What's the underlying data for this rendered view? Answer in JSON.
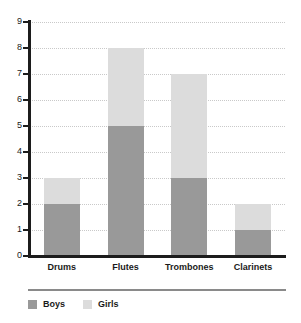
{
  "chart_data": {
    "type": "bar",
    "subtype": "stacked-vertical",
    "title": "",
    "subtitle": "",
    "xlabel": "",
    "ylabel": "",
    "categories": [
      "Drums",
      "Flutes",
      "Trombones",
      "Clarinets"
    ],
    "series": [
      {
        "name": "Boys",
        "color": "#999999",
        "values": [
          2,
          5,
          3,
          1
        ]
      },
      {
        "name": "Girls",
        "color": "#dcdcdc",
        "values": [
          1,
          3,
          4,
          1
        ]
      }
    ],
    "totals": [
      3,
      8,
      7,
      2
    ],
    "ylim": [
      0,
      9
    ],
    "ytick_step": 1,
    "ytick_labels": [
      "0",
      "1",
      "2",
      "3",
      "4",
      "5",
      "6",
      "7",
      "8",
      "9"
    ],
    "grid": true,
    "grid_style": "dotted-horizontal",
    "legend_position": "bottom-left",
    "legend_entries": [
      {
        "label": "Boys",
        "color": "#999999"
      },
      {
        "label": "Girls",
        "color": "#dcdcdc"
      }
    ],
    "axis_color": "#1c1c1c",
    "grid_color": "#c9c9c9",
    "background": "#ffffff"
  }
}
